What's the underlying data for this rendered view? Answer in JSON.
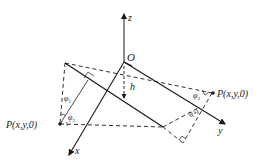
{
  "diagram": {
    "type": "3d-coordinate-geometry",
    "axes": {
      "x": {
        "label": "x"
      },
      "y": {
        "label": "y"
      },
      "z": {
        "label": "z"
      }
    },
    "origin": {
      "label": "O"
    },
    "height": {
      "label": "h"
    },
    "points": [
      {
        "id": "P_left",
        "label": "P(x,y,0)"
      },
      {
        "id": "P_right",
        "label": "P(x,y,0)"
      }
    ],
    "angles": [
      {
        "id": "phi1",
        "symbol": "φ",
        "subscript": "1"
      },
      {
        "id": "phi2",
        "symbol": "φ",
        "subscript": "2"
      },
      {
        "id": "phi3",
        "symbol": "φ",
        "subscript": "3"
      },
      {
        "id": "phi4",
        "symbol": "φ",
        "subscript": "4"
      }
    ],
    "colors": {
      "stroke": "#1a1a1a",
      "background": "#ffffff"
    }
  }
}
